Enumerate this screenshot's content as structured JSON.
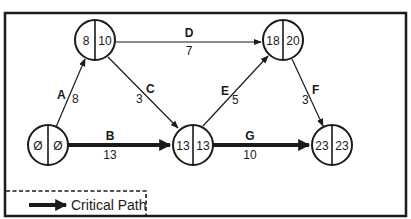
{
  "diagram": {
    "type": "activity-on-arrow network (CPM)",
    "colors": {
      "line": "#1a1a1a",
      "background": "#ffffff"
    },
    "nodes": [
      {
        "id": "n1",
        "early": "Ø",
        "late": "Ø",
        "cx": 48,
        "cy": 145
      },
      {
        "id": "n2",
        "early": "8",
        "late": "10",
        "cx": 95,
        "cy": 40
      },
      {
        "id": "n3",
        "early": "13",
        "late": "13",
        "cx": 193,
        "cy": 145
      },
      {
        "id": "n4",
        "early": "18",
        "late": "20",
        "cx": 283,
        "cy": 40
      },
      {
        "id": "n5",
        "early": "23",
        "late": "23",
        "cx": 332,
        "cy": 145
      }
    ],
    "activities": [
      {
        "name": "A",
        "duration": "8",
        "from": "n1",
        "to": "n2",
        "critical": false
      },
      {
        "name": "B",
        "duration": "13",
        "from": "n1",
        "to": "n3",
        "critical": true
      },
      {
        "name": "C",
        "duration": "3",
        "from": "n2",
        "to": "n3",
        "critical": false
      },
      {
        "name": "D",
        "duration": "7",
        "from": "n2",
        "to": "n4",
        "critical": false
      },
      {
        "name": "E",
        "duration": "5",
        "from": "n3",
        "to": "n4",
        "critical": false
      },
      {
        "name": "F",
        "duration": "3",
        "from": "n4",
        "to": "n5",
        "critical": false
      },
      {
        "name": "G",
        "duration": "10",
        "from": "n3",
        "to": "n5",
        "critical": true
      }
    ],
    "legend": {
      "label": "Critical Path"
    }
  }
}
